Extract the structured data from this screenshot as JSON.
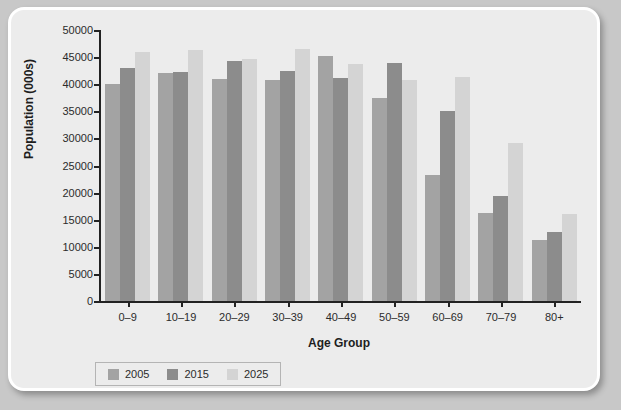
{
  "chart_data": {
    "type": "bar",
    "title": "",
    "xlabel": "Age Group",
    "ylabel": "Population (000s)",
    "categories": [
      "0–9",
      "10–19",
      "20–29",
      "30–39",
      "40–49",
      "50–59",
      "60–69",
      "70–79",
      "80+"
    ],
    "series": [
      {
        "name": "2005",
        "color": "#a3a3a3",
        "values": [
          40000,
          42000,
          41000,
          40800,
          45200,
          37500,
          23300,
          16200,
          11200
        ]
      },
      {
        "name": "2015",
        "color": "#8c8c8c",
        "values": [
          43000,
          42300,
          44300,
          42400,
          41100,
          44000,
          35000,
          19300,
          12800
        ]
      },
      {
        "name": "2025",
        "color": "#d4d4d4",
        "values": [
          46000,
          46300,
          44600,
          46500,
          43700,
          40700,
          41400,
          29200,
          16000
        ]
      }
    ],
    "ylim": [
      0,
      50000
    ],
    "yticks": [
      0,
      5000,
      10000,
      15000,
      20000,
      25000,
      30000,
      35000,
      40000,
      45000,
      50000
    ],
    "ytick_labels": [
      "0",
      "5000",
      "10000",
      "15000",
      "20000",
      "25000",
      "30000",
      "35000",
      "40000",
      "45000",
      "50000"
    ],
    "grid": false,
    "legend_position": "bottom-left",
    "axis_color": "#222222",
    "plot_background": "#ececec"
  }
}
